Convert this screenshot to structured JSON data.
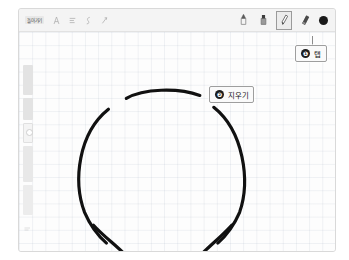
{
  "app": {
    "surface": "tablet-note-canvas",
    "frame_color": "#f1f1f1",
    "canvas_color": "#fdfdfd",
    "ink_color": "#111111",
    "grid": "faint blue-gray square grid"
  },
  "toolbar": {
    "back_label": "돌아가기",
    "format_tools": [
      {
        "name": "text-style-icon",
        "glyph": "A"
      },
      {
        "name": "list-icon",
        "glyph": "≡"
      },
      {
        "name": "insert-icon",
        "glyph": "ʃ"
      },
      {
        "name": "attach-icon",
        "glyph": "↗"
      }
    ],
    "draw_tools": [
      {
        "name": "pen-icon",
        "label": "펜",
        "selected": false
      },
      {
        "name": "marker-icon",
        "label": "마커",
        "selected": false
      },
      {
        "name": "highlighter-icon",
        "label": "형광펜",
        "selected": true
      },
      {
        "name": "eraser-icon",
        "label": "지우개",
        "selected": false
      }
    ],
    "color_swatch": {
      "name": "color-swatch-black",
      "color": "#1a1a1a"
    }
  },
  "side_strip": {
    "name": "page-thumbnail-strip",
    "segments": 5
  },
  "callouts": [
    {
      "badge": "❶",
      "text": "탭",
      "name": "callout-tap",
      "target": "highlighter-icon"
    },
    {
      "badge": "❷",
      "text": "지우기",
      "name": "callout-erase",
      "target": "canvas-stroke"
    }
  ],
  "drawing": {
    "name": "hand-drawn-figure",
    "description": "open circle head with separate top arc and two legs",
    "stroke_color": "#111111",
    "stroke_width": 3.2
  }
}
